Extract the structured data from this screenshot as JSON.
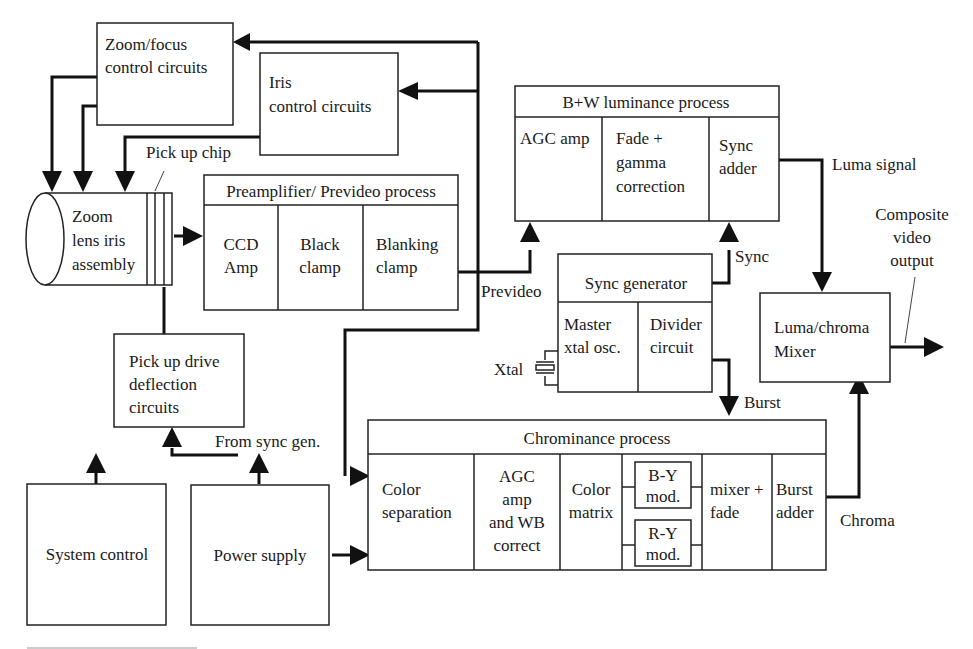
{
  "diagram": {
    "type": "block-diagram",
    "blocks": {
      "zoom_focus": {
        "line1": "Zoom/focus",
        "line2": "control circuits"
      },
      "iris": {
        "line1": "Iris",
        "line2": "control circuits"
      },
      "lens": {
        "line1": "Zoom",
        "line2": "lens iris",
        "line3": "assembly"
      },
      "preamp": {
        "title": "Preamplifier/ Prevideo process",
        "cells": [
          {
            "line1": "CCD",
            "line2": "Amp"
          },
          {
            "line1": "Black",
            "line2": "clamp"
          },
          {
            "line1": "Blanking",
            "line2": "clamp"
          }
        ]
      },
      "luminance": {
        "title": "B+W  luminance process",
        "cells": [
          {
            "line1": "AGC amp"
          },
          {
            "line1": "Fade +",
            "line2": "gamma",
            "line3": "correction"
          },
          {
            "line1": "Sync",
            "line2": "adder"
          }
        ]
      },
      "sync_gen": {
        "title": "Sync generator",
        "cells": [
          {
            "line1": "Master",
            "line2": "xtal  osc."
          },
          {
            "line1": "Divider",
            "line2": "circuit"
          }
        ]
      },
      "mixer": {
        "line1": "Luma/chroma",
        "line2": "Mixer"
      },
      "pickup_drive": {
        "line1": "Pick up drive",
        "line2": "deflection",
        "line3": "circuits"
      },
      "chroma": {
        "title": "Chrominance process",
        "cells": [
          {
            "line1": "Color",
            "line2": "separation"
          },
          {
            "line1": "AGC",
            "line2": "amp",
            "line3": "and WB",
            "line4": "correct"
          },
          {
            "line1": "Color",
            "line2": "matrix"
          },
          {
            "by_line1": "B-Y",
            "by_line2": "mod.",
            "ry_line1": "R-Y",
            "ry_line2": "mod."
          },
          {
            "line1": "mixer +",
            "line2": "fade"
          },
          {
            "line1": "Burst",
            "line2": "adder"
          }
        ]
      },
      "system_control": {
        "label": "System control"
      },
      "power_supply": {
        "label": "Power supply"
      }
    },
    "labels": {
      "pickup_chip": "Pick up chip",
      "prevideo": "Prevideo",
      "sync": "Sync",
      "luma_signal": "Luma signal",
      "composite_1": "Composite",
      "composite_2": "video",
      "composite_3": "output",
      "xtal": "Xtal",
      "burst": "Burst",
      "from_sync_gen": "From sync gen.",
      "chroma": "Chroma"
    }
  }
}
